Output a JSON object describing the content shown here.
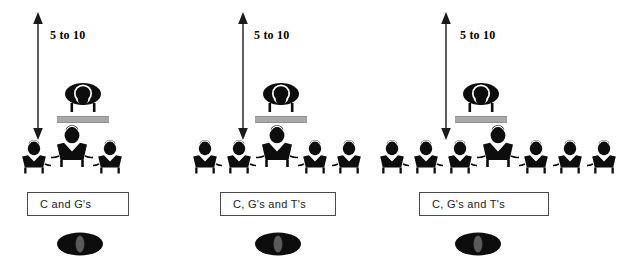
{
  "diagram": {
    "colors": {
      "figure": "#0d0d0d",
      "desk": "#a8a8a8",
      "box_border": "#4a4a4a",
      "background": "#ffffff",
      "marker_inner": "#5a5a5a"
    },
    "panels": [
      {
        "id": "panel-1",
        "gap_label": "5 to 10",
        "caption": "C and G's",
        "leader_icon": "presenter-figure-icon",
        "desk_icon": "desk-bar-icon",
        "arrow_icon": "double-headed-vertical-arrow-icon",
        "marker_icon": "ellipse-marker-icon",
        "seated_count": 3,
        "side_left_count": 1,
        "side_right_count": 1,
        "center_count": 1
      },
      {
        "id": "panel-2",
        "gap_label": "5 to 10",
        "caption": "C, G's and T's",
        "leader_icon": "presenter-figure-icon",
        "desk_icon": "desk-bar-icon",
        "arrow_icon": "double-headed-vertical-arrow-icon",
        "marker_icon": "ellipse-marker-icon",
        "seated_count": 5,
        "side_left_count": 2,
        "side_right_count": 2,
        "center_count": 1
      },
      {
        "id": "panel-3",
        "gap_label": "5 to 10",
        "caption": "C, G's and T's",
        "leader_icon": "presenter-figure-icon",
        "desk_icon": "desk-bar-icon",
        "arrow_icon": "double-headed-vertical-arrow-icon",
        "marker_icon": "ellipse-marker-icon",
        "seated_count": 7,
        "side_left_count": 3,
        "side_right_count": 3,
        "center_count": 1
      }
    ]
  }
}
